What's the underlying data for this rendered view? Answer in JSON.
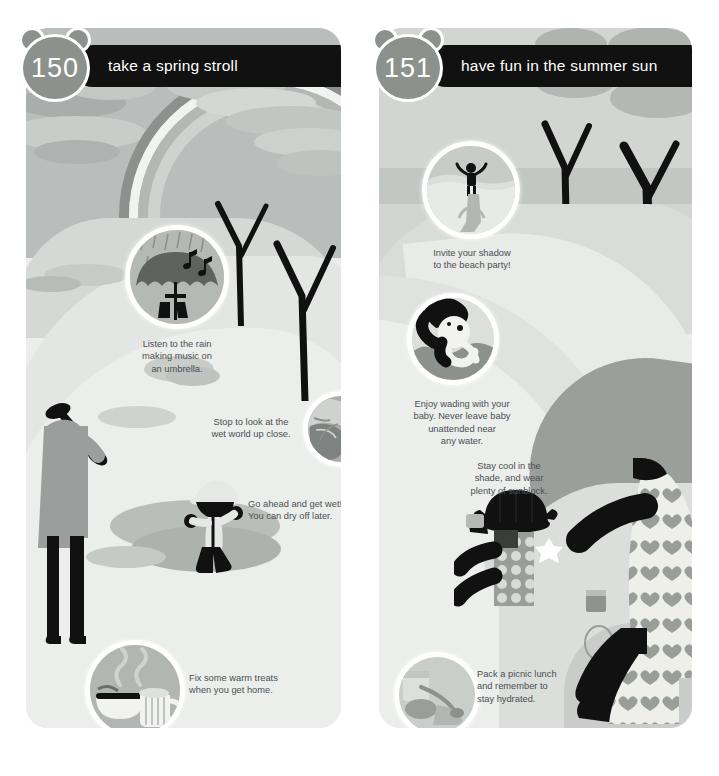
{
  "page": {
    "background": "#ffffff",
    "width": 719,
    "height": 776
  },
  "panels": [
    {
      "id": "spring",
      "badge_number": "150",
      "title": "take a spring stroll",
      "badge_color": "#8d918e",
      "header_color": "#111111",
      "scene_description": "rainy spring park with rainbow, puddles, bare trees, adult with umbrella and child splashing",
      "callouts": [
        {
          "name": "umbrella-rain",
          "caption": "Listen to the rain\nmaking music on\nan umbrella.",
          "icon": "umbrella-with-music-notes"
        },
        {
          "name": "wet-world",
          "caption": "Stop to look at the\nwet world up close.",
          "icon": "magnified-snail-leaf"
        },
        {
          "name": "get-wet",
          "caption": "Go ahead and get wet!\nYou can dry off later.",
          "icon": "none"
        },
        {
          "name": "warm-treats",
          "caption": "Fix some warm treats\nwhen you get home.",
          "icon": "steaming-mug-and-bowl"
        }
      ]
    },
    {
      "id": "summer",
      "badge_number": "151",
      "title": "have fun in the summer sun",
      "badge_color": "#8d918e",
      "header_color": "#111111",
      "scene_description": "sunny summer park with winding path, leafy trees, mother and baby picnicking in shade",
      "callouts": [
        {
          "name": "shadow-party",
          "caption": "Invite your shadow\nto the beach party!",
          "icon": "child-with-long-shadow"
        },
        {
          "name": "wading-baby",
          "caption": "Enjoy wading with your\nbaby. Never leave baby\nunattended near\nany water.",
          "icon": "adult-holding-baby-in-water"
        },
        {
          "name": "stay-cool",
          "caption": "Stay cool in the\nshade, and wear\nplenty of sunblock.",
          "icon": "none"
        },
        {
          "name": "picnic-lunch",
          "caption": "Pack a picnic lunch\nand remember to\nstay hydrated.",
          "icon": "picnic-basket-thermos"
        }
      ]
    }
  ],
  "palette": {
    "panel_bg": "#eceeec",
    "sky": "#b9bdbb",
    "grass_light": "#d9dcd9",
    "grass_mid": "#c6cac7",
    "water": "#a7abab",
    "ink": "#111111",
    "coat": "#9a9e9c",
    "text": "#4b4f52",
    "white": "#ffffff",
    "rainbow_dark": "#8d918e",
    "rainbow_mid": "#c0c4c1",
    "sand": "#e2e4e1"
  }
}
